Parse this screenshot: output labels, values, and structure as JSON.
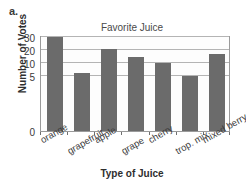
{
  "figure": {
    "part_label": "a."
  },
  "chart_data": {
    "type": "bar",
    "title": "Favorite Juice",
    "xlabel": "Type of Juice",
    "ylabel": "Number of Votes",
    "categories": [
      "orange",
      "grapefruit",
      "apple",
      "grape",
      "cherry",
      "trop. mix",
      "mixed berry"
    ],
    "values": [
      30,
      6,
      21,
      15,
      10,
      5,
      17
    ],
    "ytick_labels": [
      "0",
      "5",
      "10",
      "20",
      "30"
    ],
    "ytick_values": [
      0,
      5,
      10,
      20,
      30
    ],
    "axis_note": "non-linear y-axis: equal pixel spacing between 5, 10, 20, 30 ticks",
    "grid": true,
    "legend": "none",
    "bar_color": "#6b6b6b",
    "grid_color": "#b4b4b4",
    "frame_color": "#9a9a9a"
  }
}
